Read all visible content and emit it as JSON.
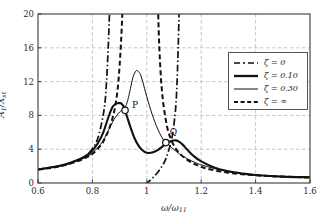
{
  "chart_data": {
    "type": "line",
    "title": "",
    "xlabel": "ω/ω₁₁",
    "ylabel": "A₁/Xₛₜ",
    "xlim": [
      0.6,
      1.6
    ],
    "ylim": [
      0,
      20
    ],
    "xticks": [
      "0.6",
      "0.8",
      "1",
      "1.2",
      "1.4",
      "1.6"
    ],
    "yticks": [
      "0",
      "4",
      "8",
      "12",
      "16",
      "20"
    ],
    "grid": true,
    "legend_position": "upper right",
    "series": [
      {
        "name": "ζ = 0",
        "style": "dash-dot",
        "width": 1.7,
        "color": "#111111",
        "asymptotes": [
          0.875,
          1.135
        ],
        "notch_x": 1.0,
        "notch_y": 0.0,
        "x": [
          0.6,
          0.65,
          0.7,
          0.75,
          0.78,
          0.8,
          0.82,
          0.84,
          0.85,
          0.86,
          0.865,
          0.87,
          0.872,
          0.878,
          0.88,
          0.885,
          0.89,
          0.9,
          0.91,
          0.92,
          0.93,
          0.94,
          0.95,
          0.96,
          0.97,
          0.98,
          0.99,
          0.995,
          1.0,
          1.005,
          1.01,
          1.02,
          1.03,
          1.05,
          1.07,
          1.09,
          1.1,
          1.11,
          1.12,
          1.125,
          1.13,
          1.132,
          1.138,
          1.14,
          1.145,
          1.15,
          1.16,
          1.18,
          1.2,
          1.25,
          1.3,
          1.4,
          1.5,
          1.6
        ],
        "y": [
          1.62,
          1.85,
          2.18,
          2.75,
          3.35,
          4.05,
          5.3,
          8.1,
          11.0,
          17.5,
          24.0,
          40.0,
          60.0,
          -60.0,
          -40.0,
          -22.0,
          -14.5,
          -8.4,
          -5.6,
          -4.0,
          -2.95,
          -2.2,
          -1.62,
          -1.18,
          -0.82,
          -0.52,
          -0.24,
          -0.12,
          0.0,
          0.13,
          0.26,
          0.55,
          0.88,
          1.7,
          2.85,
          5.0,
          7.0,
          11.0,
          22.0,
          35.0,
          60.0,
          80.0,
          -80.0,
          -60.0,
          -28.0,
          -18.0,
          -10.2,
          -5.4,
          -3.65,
          -1.95,
          -1.4,
          -0.95,
          -0.78,
          -0.68
        ]
      },
      {
        "name": "ζ = 0.10",
        "style": "solid",
        "width": 2.1,
        "color": "#111111",
        "peak1": {
          "x": 0.905,
          "y": 9.45
        },
        "valley": {
          "x": 1.0,
          "y": 3.55
        },
        "peak2": {
          "x": 1.105,
          "y": 5.05
        },
        "x": [
          0.6,
          0.65,
          0.7,
          0.75,
          0.78,
          0.8,
          0.82,
          0.84,
          0.86,
          0.875,
          0.89,
          0.9,
          0.905,
          0.915,
          0.925,
          0.94,
          0.955,
          0.97,
          0.985,
          1.0,
          1.02,
          1.04,
          1.055,
          1.07,
          1.085,
          1.1,
          1.105,
          1.115,
          1.13,
          1.15,
          1.17,
          1.2,
          1.25,
          1.3,
          1.35,
          1.4,
          1.5,
          1.6
        ],
        "y": [
          1.62,
          1.86,
          2.2,
          2.78,
          3.3,
          3.85,
          4.7,
          6.0,
          7.9,
          9.05,
          9.42,
          9.45,
          9.44,
          9.05,
          8.1,
          6.6,
          5.3,
          4.4,
          3.85,
          3.58,
          3.6,
          3.9,
          4.25,
          4.6,
          4.92,
          5.04,
          5.05,
          4.95,
          4.6,
          3.9,
          3.25,
          2.55,
          1.8,
          1.38,
          1.12,
          0.95,
          0.76,
          0.68
        ]
      },
      {
        "name": "ζ = 0.30",
        "style": "solid",
        "width": 1.0,
        "color": "#111111",
        "peak": {
          "x": 0.965,
          "y": 13.3
        },
        "x": [
          0.6,
          0.65,
          0.7,
          0.75,
          0.78,
          0.8,
          0.82,
          0.84,
          0.86,
          0.88,
          0.9,
          0.91,
          0.92,
          0.93,
          0.94,
          0.95,
          0.96,
          0.965,
          0.975,
          0.985,
          1.0,
          1.02,
          1.04,
          1.06,
          1.07,
          1.08,
          1.1,
          1.12,
          1.15,
          1.18,
          1.2,
          1.25,
          1.3,
          1.35,
          1.4,
          1.5,
          1.6
        ],
        "y": [
          1.6,
          1.83,
          2.15,
          2.68,
          3.12,
          3.55,
          4.2,
          5.05,
          6.3,
          7.55,
          8.4,
          8.62,
          8.9,
          9.8,
          11.2,
          12.6,
          13.25,
          13.3,
          12.95,
          12.0,
          10.2,
          8.1,
          6.4,
          5.15,
          4.8,
          4.52,
          3.95,
          3.45,
          2.85,
          2.4,
          2.15,
          1.7,
          1.35,
          1.12,
          0.95,
          0.74,
          0.64
        ]
      },
      {
        "name": "ζ = ∞",
        "style": "dashed",
        "width": 2.0,
        "color": "#111111",
        "asymptote": 1.028,
        "x": [
          0.6,
          0.65,
          0.7,
          0.75,
          0.78,
          0.8,
          0.82,
          0.84,
          0.86,
          0.875,
          0.885,
          0.895,
          0.905,
          0.912,
          0.918,
          0.922,
          0.926,
          0.932,
          0.938,
          0.95,
          0.96,
          0.975,
          0.99,
          1.0,
          1.008,
          1.015,
          1.02,
          1.024,
          1.032,
          1.036,
          1.042,
          1.05,
          1.06,
          1.075,
          1.09,
          1.11,
          1.14,
          1.18,
          1.22,
          1.28,
          1.35,
          1.45,
          1.6
        ],
        "y": [
          1.58,
          1.8,
          2.12,
          2.62,
          3.05,
          3.45,
          4.05,
          4.9,
          6.3,
          7.8,
          9.3,
          11.8,
          16.5,
          22.0,
          30.0,
          42.0,
          70.0,
          -70.0,
          -42.0,
          -24.0,
          -18.0,
          -14.0,
          -13.5,
          -14.5,
          -17.0,
          -22.0,
          -32.0,
          -55.0,
          55.0,
          32.0,
          20.0,
          13.5,
          9.6,
          6.6,
          5.1,
          3.9,
          2.95,
          2.18,
          1.72,
          1.32,
          1.04,
          0.82,
          0.64
        ]
      }
    ],
    "annotations": [
      {
        "label": "P",
        "x": 0.92,
        "y": 8.6,
        "marker": "circle",
        "label_dx": 7,
        "label_dy": -4
      },
      {
        "label": "Q",
        "x": 1.07,
        "y": 4.78,
        "marker": "circle",
        "label_dx": 4,
        "label_dy": -10
      }
    ]
  },
  "axes": {
    "x_title_main": "ω",
    "x_title_den": "ω",
    "x_title_sub": "11",
    "y_title_num": "A",
    "y_title_num_sub": "1",
    "y_title_den": "X",
    "y_title_den_sub": "st"
  },
  "legend": {
    "items": [
      {
        "label": "ζ = 0",
        "key": "dash-dot"
      },
      {
        "label": "ζ = 0.10",
        "key": "solid-thick"
      },
      {
        "label": "ζ = 0.30",
        "key": "solid-thin"
      },
      {
        "label": "ζ = ∞",
        "key": "dashed"
      }
    ]
  },
  "colors": {
    "axis": "#3a3a3a",
    "grid": "#b9b9b9",
    "curve": "#111111",
    "background": "#ffffff"
  }
}
